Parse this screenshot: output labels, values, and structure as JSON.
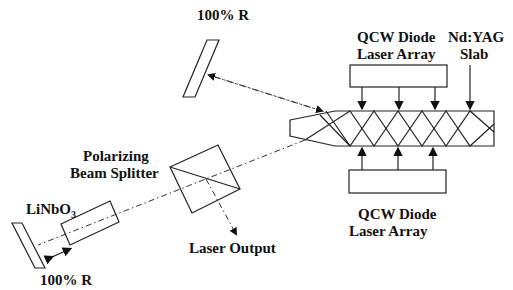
{
  "diagram": {
    "labels": {
      "top_mirror": "100% R",
      "top_diode": [
        "QCW Diode",
        "Laser Array"
      ],
      "slab": [
        "Nd:YAG",
        "Slab"
      ],
      "bottom_diode": [
        "QCW Diode",
        "Laser Array"
      ],
      "beam_splitter": [
        "Polarizing",
        "Beam Splitter"
      ],
      "linbo3": "LiNbO",
      "linbo3_sub": "3",
      "laser_output": "Laser Output",
      "bottom_mirror": "100% R"
    },
    "components": [
      "100% R mirror (top)",
      "QCW Diode Laser Array (top)",
      "Nd:YAG Slab",
      "QCW Diode Laser Array (bottom)",
      "Polarizing Beam Splitter",
      "LiNbO3 crystal",
      "100% R mirror (bottom)"
    ],
    "colors": {
      "line": "#222222",
      "background": "#ffffff"
    }
  }
}
